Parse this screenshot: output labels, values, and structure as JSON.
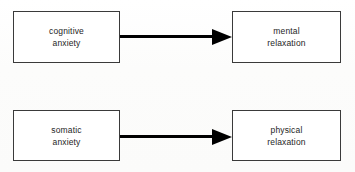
{
  "diagram": {
    "background_color": "#fdfdfd",
    "box_border_color": "#3a3a3a",
    "arrow_color": "#000000",
    "text_color": "#1e1e1e",
    "nodes": [
      {
        "id": "cognitive-anxiety",
        "line1": "cognitive",
        "line2": "anxiety",
        "x": 13,
        "y": 11,
        "width": 107,
        "height": 52
      },
      {
        "id": "mental-relaxation",
        "line1": "mental",
        "line2": "relaxation",
        "x": 232,
        "y": 11,
        "width": 109,
        "height": 52
      },
      {
        "id": "somatic-anxiety",
        "line1": "somatic",
        "line2": "anxiety",
        "x": 13,
        "y": 110,
        "width": 107,
        "height": 51
      },
      {
        "id": "physical-relaxation",
        "line1": "physical",
        "line2": "relaxation",
        "x": 232,
        "y": 110,
        "width": 109,
        "height": 51
      }
    ],
    "arrows": [
      {
        "id": "arrow-cognitive-to-mental",
        "from": "cognitive-anxiety",
        "to": "mental-relaxation",
        "direction": "right",
        "x": 120,
        "y": 29,
        "length": 112,
        "shaft_length": 92,
        "head_length": 20
      },
      {
        "id": "arrow-somatic-to-physical",
        "from": "somatic-anxiety",
        "to": "physical-relaxation",
        "direction": "right",
        "x": 120,
        "y": 129,
        "length": 112,
        "shaft_length": 92,
        "head_length": 20
      }
    ]
  }
}
